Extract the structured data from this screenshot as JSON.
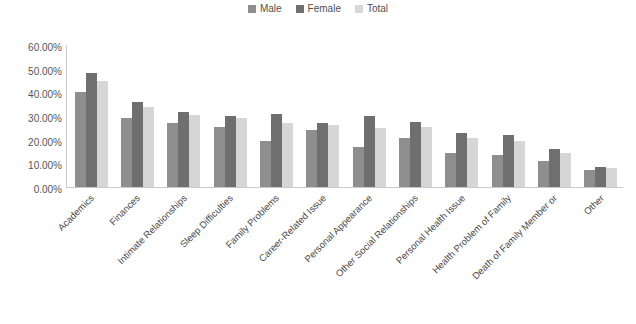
{
  "chart_data": {
    "type": "bar",
    "title": "",
    "xlabel": "",
    "ylabel": "",
    "ylim": [
      0,
      60
    ],
    "grid": false,
    "legend_position": "top-center",
    "y_ticks": [
      "60.00%",
      "50.00%",
      "40.00%",
      "30.00%",
      "20.00%",
      "10.00%",
      "0.00%"
    ],
    "y_tick_values": [
      60,
      50,
      40,
      30,
      20,
      10,
      0
    ],
    "categories": [
      "Academics",
      "Finances",
      "Intimate Relationships",
      "Sleep Difficulties",
      "Family Problems",
      "Career-Related Issue",
      "Personal Appearance",
      "Other Social Relationships",
      "Personal Health Issue",
      "Health Problem of Family",
      "Death of Family Member or",
      "Other"
    ],
    "series": [
      {
        "name": "Male",
        "color": "#8e8e8e",
        "values": [
          40.0,
          29.0,
          27.0,
          25.5,
          19.5,
          24.0,
          17.0,
          20.5,
          14.5,
          13.5,
          11.0,
          7.0
        ]
      },
      {
        "name": "Female",
        "color": "#6f6f6f",
        "values": [
          48.0,
          36.0,
          31.5,
          30.0,
          31.0,
          27.0,
          30.0,
          27.5,
          23.0,
          22.0,
          16.0,
          8.5
        ]
      },
      {
        "name": "Total",
        "color": "#d6d6d6",
        "values": [
          45.0,
          34.0,
          30.5,
          29.0,
          27.0,
          26.0,
          25.0,
          25.5,
          20.5,
          19.5,
          14.5,
          8.0
        ]
      }
    ]
  }
}
